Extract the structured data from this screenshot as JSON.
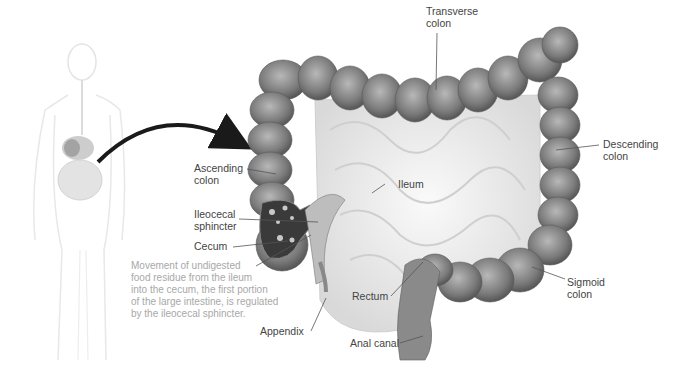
{
  "figure": {
    "labels": {
      "transverse_colon": "Transverse\ncolon",
      "descending_colon": "Descending\ncolon",
      "ascending_colon": "Ascending\ncolon",
      "ileum": "Ileum",
      "ileocecal_sphincter": "Ileocecal\nsphincter",
      "cecum": "Cecum",
      "rectum": "Rectum",
      "sigmoid_colon": "Sigmoid\ncolon",
      "appendix": "Appendix",
      "anal_canal": "Anal canal"
    },
    "caption": "Movement of undigested\nfood residue from the ileum\ninto the cecum, the first portion\nof the large intestine, is regulated\nby the ileocecal sphincter.",
    "colors": {
      "label_text": "#444444",
      "caption_text": "#a8a8a8",
      "colon_dark": "#6e6e6e",
      "colon_light": "#b0b0b0",
      "arrow": "#1a1a1a",
      "body_outline": "#e6e6e6"
    }
  }
}
